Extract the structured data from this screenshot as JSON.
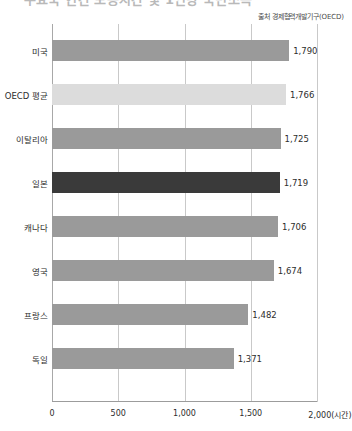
{
  "header": {
    "title": "주요국 연간 노동시간 및 1인당 국민소득",
    "source_note": "출처 경제협력개발기구(OECD)"
  },
  "chart_data": {
    "type": "bar",
    "orientation": "horizontal",
    "title": "주요국 연간 노동시간 및 1인당 국민소득",
    "xlabel": "2,000(시간)",
    "ylabel": "",
    "xlim": [
      0,
      2000
    ],
    "grid": true,
    "legend": "none",
    "categories": [
      "미국",
      "OECD 평균",
      "이탈리아",
      "일본",
      "캐나다",
      "영국",
      "프랑스",
      "독일"
    ],
    "values": [
      1790,
      1766,
      1725,
      1719,
      1706,
      1674,
      1482,
      1371
    ],
    "value_labels": [
      "1,790",
      "1,766",
      "1,725",
      "1,719",
      "1,706",
      "1,674",
      "1,482",
      "1,371"
    ],
    "xticks": [
      0,
      500,
      1000,
      1500,
      2000
    ],
    "xtick_labels": [
      "0",
      "500",
      "1,000",
      "1,500",
      "2,000(시간)"
    ],
    "bar_styles": [
      "default",
      "light",
      "default",
      "highlight",
      "default",
      "default",
      "default",
      "default"
    ],
    "colors": {
      "default": "#9a9a9a",
      "light": "#dcdcdc",
      "highlight": "#3a3a3a",
      "gridline": "#c9c9c9",
      "axis": "#9c9c9c",
      "text": "#2d2d2d"
    }
  }
}
